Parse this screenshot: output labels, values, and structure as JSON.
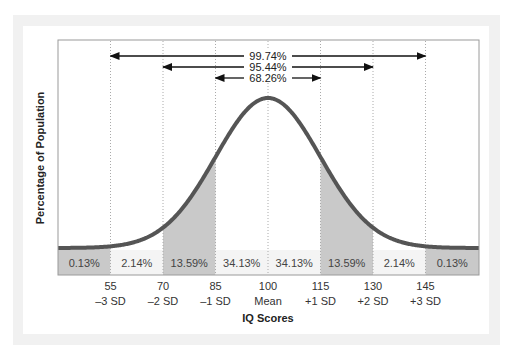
{
  "chart_data": {
    "type": "area",
    "title": "",
    "xlabel": "IQ Scores",
    "ylabel": "Percentage of Population",
    "distribution": "normal",
    "mean": 100,
    "sd": 15,
    "x_ticks": [
      {
        "value": "55",
        "sd_label": "–3 SD"
      },
      {
        "value": "70",
        "sd_label": "–2 SD"
      },
      {
        "value": "85",
        "sd_label": "–1 SD"
      },
      {
        "value": "100",
        "sd_label": "Mean"
      },
      {
        "value": "115",
        "sd_label": "+1 SD"
      },
      {
        "value": "130",
        "sd_label": "+2 SD"
      },
      {
        "value": "145",
        "sd_label": "+3 SD"
      }
    ],
    "regions": [
      {
        "range": "<55",
        "percent": "0.13%",
        "shaded": true
      },
      {
        "range": "55-70",
        "percent": "2.14%",
        "shaded": false
      },
      {
        "range": "70-85",
        "percent": "13.59%",
        "shaded": true
      },
      {
        "range": "85-100",
        "percent": "34.13%",
        "shaded": false
      },
      {
        "range": "100-115",
        "percent": "34.13%",
        "shaded": false
      },
      {
        "range": "115-130",
        "percent": "13.59%",
        "shaded": true
      },
      {
        "range": "130-145",
        "percent": "2.14%",
        "shaded": false
      },
      {
        "range": ">145",
        "percent": "0.13%",
        "shaded": true
      }
    ],
    "annotations": [
      {
        "label": "99.74%",
        "from": "55",
        "to": "145"
      },
      {
        "label": "95.44%",
        "from": "70",
        "to": "130"
      },
      {
        "label": "68.26%",
        "from": "85",
        "to": "115"
      }
    ],
    "grid": "vertical dotted lines at SD marks",
    "colors": {
      "curve": "#555555",
      "shaded": "#c9c9c9",
      "unshaded_band": "#f4f4f4"
    }
  }
}
